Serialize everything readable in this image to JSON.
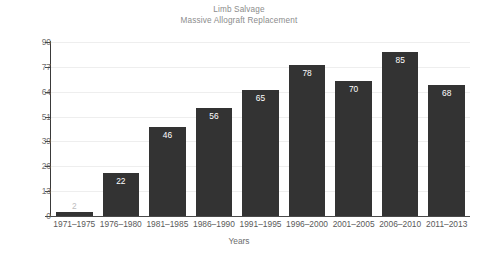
{
  "chart_data": {
    "type": "bar",
    "title": "Limb Salvage",
    "subtitle": "Massive Allograft Replacement",
    "xlabel": "Years",
    "ylabel": "Cases",
    "categories": [
      "1971–1975",
      "1976–1980",
      "1981–1985",
      "1986–1990",
      "1991–1995",
      "1996–2000",
      "2001–2005",
      "2006–2010",
      "2011–2013"
    ],
    "values": [
      2,
      22,
      46,
      56,
      65,
      78,
      70,
      85,
      68
    ],
    "value_labels": [
      "2",
      "22",
      "46",
      "56",
      "65",
      "78",
      "70",
      "85",
      "68"
    ],
    "yticks": [
      0,
      13,
      26,
      39,
      51,
      64,
      77,
      90
    ],
    "ytick_labels": [
      "0",
      "13",
      "26",
      "39",
      "51",
      "64",
      "77",
      "90"
    ],
    "ylim": [
      0,
      90
    ],
    "grid": "horizontal",
    "legend": "none",
    "bar_color": "#333333",
    "label_color": "#ffffff",
    "grid_color": "#eeeeee",
    "axis_color": "#4a4a4a",
    "title_color": "#8c8c8c",
    "tick_color": "#6e6e6e"
  }
}
